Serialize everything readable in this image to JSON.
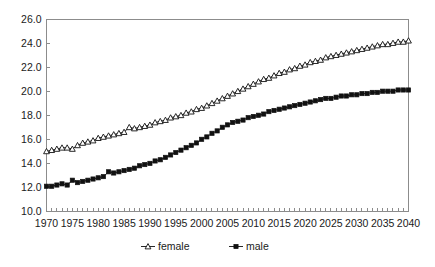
{
  "chart_data": {
    "type": "line",
    "title": "",
    "subtitle": "",
    "xlabel": "",
    "ylabel": "",
    "xlim": [
      1970,
      2040
    ],
    "ylim": [
      10.0,
      26.0
    ],
    "grid": false,
    "legend_position": "bottom-center",
    "y_ticks": [
      "10.0",
      "12.0",
      "14.0",
      "16.0",
      "18.0",
      "20.0",
      "22.0",
      "24.0",
      "26.0"
    ],
    "y_tick_values": [
      10.0,
      12.0,
      14.0,
      16.0,
      18.0,
      20.0,
      22.0,
      24.0,
      26.0
    ],
    "x_ticks": [
      "1970",
      "1975",
      "1980",
      "1985",
      "1990",
      "1995",
      "2000",
      "2005",
      "2010",
      "2015",
      "2020",
      "2025",
      "2030",
      "2035",
      "2040"
    ],
    "x_tick_values": [
      1970,
      1975,
      1980,
      1985,
      1990,
      1995,
      2000,
      2005,
      2010,
      2015,
      2020,
      2025,
      2030,
      2035,
      2040
    ],
    "x": [
      1970,
      1971,
      1972,
      1973,
      1974,
      1975,
      1976,
      1977,
      1978,
      1979,
      1980,
      1981,
      1982,
      1983,
      1984,
      1985,
      1986,
      1987,
      1988,
      1989,
      1990,
      1991,
      1992,
      1993,
      1994,
      1995,
      1996,
      1997,
      1998,
      1999,
      2000,
      2001,
      2002,
      2003,
      2004,
      2005,
      2006,
      2007,
      2008,
      2009,
      2010,
      2011,
      2012,
      2013,
      2014,
      2015,
      2016,
      2017,
      2018,
      2019,
      2020,
      2021,
      2022,
      2023,
      2024,
      2025,
      2026,
      2027,
      2028,
      2029,
      2030,
      2031,
      2032,
      2033,
      2034,
      2035,
      2036,
      2037,
      2038,
      2039,
      2040
    ],
    "series": [
      {
        "name": "female",
        "marker": "open-triangle",
        "color": "#111111",
        "values": [
          15.0,
          15.1,
          15.2,
          15.3,
          15.3,
          15.2,
          15.5,
          15.7,
          15.8,
          15.9,
          16.1,
          16.2,
          16.3,
          16.4,
          16.5,
          16.6,
          17.0,
          16.9,
          17.0,
          17.1,
          17.2,
          17.4,
          17.5,
          17.6,
          17.8,
          17.9,
          18.0,
          18.2,
          18.3,
          18.5,
          18.6,
          18.8,
          19.0,
          19.2,
          19.4,
          19.6,
          19.8,
          20.0,
          20.2,
          20.4,
          20.6,
          20.8,
          21.0,
          21.1,
          21.3,
          21.5,
          21.6,
          21.8,
          21.9,
          22.1,
          22.2,
          22.4,
          22.5,
          22.6,
          22.8,
          22.9,
          23.0,
          23.1,
          23.2,
          23.3,
          23.4,
          23.5,
          23.6,
          23.7,
          23.8,
          23.9,
          23.9,
          24.0,
          24.1,
          24.1,
          24.2
        ]
      },
      {
        "name": "male",
        "marker": "filled-square",
        "color": "#111111",
        "values": [
          12.1,
          12.1,
          12.2,
          12.3,
          12.2,
          12.6,
          12.4,
          12.5,
          12.6,
          12.7,
          12.8,
          12.9,
          13.3,
          13.2,
          13.3,
          13.4,
          13.5,
          13.6,
          13.8,
          13.9,
          14.0,
          14.2,
          14.3,
          14.5,
          14.7,
          14.9,
          15.1,
          15.3,
          15.5,
          15.7,
          16.0,
          16.2,
          16.5,
          16.7,
          17.0,
          17.2,
          17.4,
          17.5,
          17.6,
          17.8,
          17.9,
          18.0,
          18.1,
          18.3,
          18.4,
          18.5,
          18.6,
          18.7,
          18.8,
          18.9,
          19.0,
          19.1,
          19.2,
          19.3,
          19.4,
          19.4,
          19.5,
          19.6,
          19.6,
          19.7,
          19.7,
          19.8,
          19.8,
          19.9,
          19.9,
          20.0,
          20.0,
          20.0,
          20.1,
          20.1,
          20.1
        ]
      }
    ],
    "legend": [
      {
        "label": "female",
        "marker": "open-triangle"
      },
      {
        "label": "male",
        "marker": "filled-square"
      }
    ]
  }
}
